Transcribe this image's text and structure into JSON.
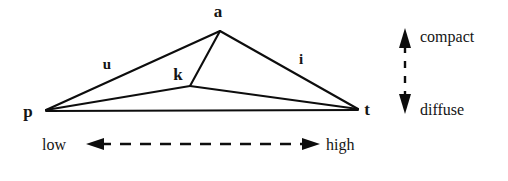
{
  "figure": {
    "background_color": "#ffffff",
    "ink_color": "#0d0d0d"
  },
  "vertices": [
    {
      "id": "a",
      "label": "a",
      "x": 220,
      "y": 31,
      "label_x": 218,
      "label_y": 17
    },
    {
      "id": "p",
      "label": "p",
      "x": 46,
      "y": 110,
      "label_x": 28,
      "label_y": 112
    },
    {
      "id": "t",
      "label": "t",
      "x": 358,
      "y": 109,
      "label_x": 366,
      "label_y": 110
    },
    {
      "id": "k",
      "label": "k",
      "x": 190,
      "y": 86,
      "label_x": 178,
      "label_y": 75
    }
  ],
  "edges": [
    {
      "id": "p-a",
      "from": "p",
      "to": "a",
      "label": "u",
      "label_x": 107,
      "label_y": 64
    },
    {
      "id": "a-t",
      "from": "a",
      "to": "t",
      "label": "i",
      "label_x": 301,
      "label_y": 60
    },
    {
      "id": "a-k",
      "from": "a",
      "to": "k",
      "label": "",
      "label_x": 0,
      "label_y": 0
    },
    {
      "id": "p-k",
      "from": "p",
      "to": "k",
      "label": "",
      "label_x": 0,
      "label_y": 0
    },
    {
      "id": "k-t",
      "from": "k",
      "to": "t",
      "label": "",
      "label_x": 0,
      "label_y": 0
    },
    {
      "id": "p-t",
      "from": "p",
      "to": "t",
      "label": "",
      "label_x": 0,
      "label_y": 0
    }
  ],
  "horizontal_axis": {
    "left_label": "low",
    "right_label": "high",
    "style": "dashed-double-arrow",
    "y": 144,
    "x_start": 88,
    "x_end": 318,
    "left_label_x": 42,
    "right_label_x": 326
  },
  "vertical_axis": {
    "top_label": "compact",
    "bottom_label": "diffuse",
    "style": "dashed-double-arrow",
    "x": 405,
    "y_top": 30,
    "y_bottom": 112,
    "top_label_x": 420,
    "top_label_y": 42,
    "bottom_label_x": 420,
    "bottom_label_y": 110
  }
}
